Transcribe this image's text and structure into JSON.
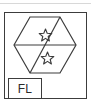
{
  "drawing": {
    "title": "FL",
    "colors": {
      "stroke": "#3c3c3c",
      "text": "#2b2b2b",
      "background": "#ffffff",
      "top_rule": "#d8d8d8"
    },
    "frame": {
      "name": "outer-frame",
      "shape": "rectangle"
    },
    "hexagon": {
      "name": "hexagon",
      "orientation": "pointy-left-right",
      "internal_lines": [
        "horizontal-midline",
        "diagonal-lower-left-to-upper-right"
      ]
    },
    "markers": [
      {
        "name": "star-upper",
        "glyph": "star-icon",
        "points": 5,
        "filled": false,
        "region": "upper-right"
      },
      {
        "name": "star-lower",
        "glyph": "star-icon",
        "points": 5,
        "filled": false,
        "region": "lower-middle"
      }
    ],
    "label_box": {
      "name": "label-box",
      "text": "FL"
    }
  }
}
